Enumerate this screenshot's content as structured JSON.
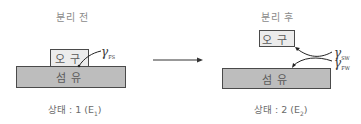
{
  "before": {
    "title": "분리 전",
    "soil_label": "오구",
    "fiber_label": "섬유",
    "gamma_symbol": "γ",
    "gamma_subscript": "FS",
    "caption_prefix": "상태 : 1 (E",
    "caption_sub": "1",
    "caption_suffix": ")"
  },
  "after": {
    "title": "분리 후",
    "soil_label": "오구",
    "fiber_label": "섬유",
    "gamma_sw_symbol": "γ",
    "gamma_sw_subscript": "SW",
    "gamma_fw_symbol": "γ",
    "gamma_fw_subscript": "FW",
    "caption_prefix": "상태 : 2 (E",
    "caption_sub": "2",
    "caption_suffix": ")"
  },
  "colors": {
    "soil_fill": "#ececec",
    "fiber_fill": "#bdbdbd",
    "border": "#4a4a4a",
    "text": "#6b6b6b"
  }
}
